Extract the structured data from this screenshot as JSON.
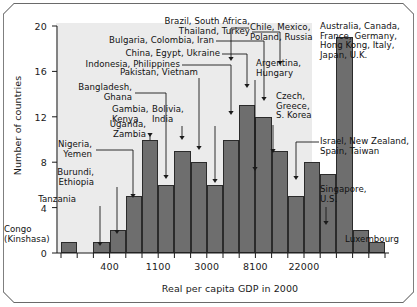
{
  "chart_data": {
    "type": "bar",
    "title": "",
    "subtitle": "",
    "xlabel": "Real per capita GDP in 2000",
    "ylabel": "Number of countries",
    "ylim": [
      0,
      20
    ],
    "yticks": [
      0,
      4,
      8,
      12,
      16,
      20
    ],
    "ytick_labels": [
      "0",
      "4",
      "8",
      "12",
      "16",
      "20"
    ],
    "xtick_labels": [
      "400",
      "1100",
      "3000",
      "8100",
      "22000"
    ],
    "x_scale": "log",
    "grid": false,
    "legend": "none",
    "bin_count": 20,
    "categories": [
      "bin1",
      "bin2",
      "bin3",
      "bin4",
      "bin5",
      "bin6",
      "bin7",
      "bin8",
      "bin9",
      "bin10",
      "bin11",
      "bin12",
      "bin13",
      "bin14",
      "bin15",
      "bin16",
      "bin17",
      "bin18",
      "bin19",
      "bin20"
    ],
    "values": [
      1,
      0,
      1,
      2,
      5,
      10,
      6,
      9,
      8,
      6,
      10,
      13,
      12,
      9,
      5,
      8,
      7,
      19,
      2,
      1
    ],
    "bar_color": "#6e6e6e",
    "bar_edge_color": "#2b2b2b",
    "plot_background": "#ebebeb",
    "annotations": [
      {
        "id": "congo",
        "text": "Congo\n(Kinshasa)",
        "align": "left"
      },
      {
        "id": "tanzania",
        "text": "Tanzania",
        "align": "right"
      },
      {
        "id": "burundi",
        "text": "Burundi,\nEthiopia",
        "align": "right"
      },
      {
        "id": "nigeria",
        "text": "Nigeria,\nYemen",
        "align": "right"
      },
      {
        "id": "uganda",
        "text": "Uganda,\nZambia",
        "align": "right"
      },
      {
        "id": "bangladesh",
        "text": "Bangladesh,\nGhana",
        "align": "right"
      },
      {
        "id": "gambia",
        "text": "Gambia,\nKenya",
        "align": "left"
      },
      {
        "id": "pakistan",
        "text": "Pakistan, Vietnam",
        "align": "right"
      },
      {
        "id": "bolivia",
        "text": "Bolivia,\nIndia",
        "align": "left"
      },
      {
        "id": "indonesia",
        "text": "Indonesia, Philippines",
        "align": "right"
      },
      {
        "id": "china",
        "text": "China, Egypt, Ukraine",
        "align": "right"
      },
      {
        "id": "bulgaria",
        "text": "Bulgaria, Colombia, Iran",
        "align": "right"
      },
      {
        "id": "brazil",
        "text": "Brazil, South Africa,\nThailand, Turkey",
        "align": "right"
      },
      {
        "id": "chile",
        "text": "Chile, Mexico,\nPoland, Russia",
        "align": "left"
      },
      {
        "id": "argentina",
        "text": "Argentina,\nHungary",
        "align": "left"
      },
      {
        "id": "czech",
        "text": "Czech,\nGreece,\nS. Korea",
        "align": "left"
      },
      {
        "id": "israel",
        "text": "Israel, New Zealand,\nSpain, Taiwan",
        "align": "left"
      },
      {
        "id": "australia",
        "text": "Australia, Canada,\nFrance, Germany,\nHong Kong, Italy,\nJapan, U.K.",
        "align": "left"
      },
      {
        "id": "singapore",
        "text": "Singapore,\nU.S.",
        "align": "left"
      },
      {
        "id": "luxembourg",
        "text": "Luxembourg",
        "align": "left"
      }
    ]
  }
}
